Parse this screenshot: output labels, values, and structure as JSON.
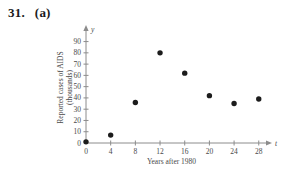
{
  "problem": {
    "number": "31.",
    "part": "(a)"
  },
  "chart_data": {
    "type": "scatter",
    "title": "",
    "xlabel": "Years after 1980",
    "ylabel_line1": "Reported cases of AIDS",
    "ylabel_line2": "(thousands)",
    "x_axis_symbol": "t",
    "y_axis_symbol": "y",
    "x_ticks": [
      0,
      4,
      8,
      12,
      16,
      20,
      24,
      28
    ],
    "y_ticks": [
      0,
      10,
      20,
      30,
      40,
      50,
      60,
      70,
      80,
      90
    ],
    "xlim": [
      0,
      30
    ],
    "ylim": [
      0,
      95
    ],
    "points": [
      {
        "t": 0,
        "y": 1
      },
      {
        "t": 4,
        "y": 7
      },
      {
        "t": 8,
        "y": 36
      },
      {
        "t": 12,
        "y": 80
      },
      {
        "t": 16,
        "y": 62
      },
      {
        "t": 20,
        "y": 42
      },
      {
        "t": 24,
        "y": 35
      },
      {
        "t": 28,
        "y": 39
      }
    ],
    "legend": null,
    "grid": false,
    "point_color": "#1c1c1c",
    "axis_color": "#8c8c8c",
    "label_color": "#4a4a4a"
  }
}
